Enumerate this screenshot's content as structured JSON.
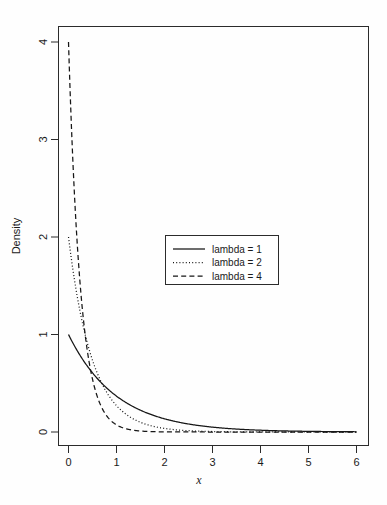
{
  "chart_data": {
    "type": "line",
    "title": "",
    "subtitle": "",
    "xlabel": "x",
    "ylabel": "Density",
    "xlim": [
      0,
      6
    ],
    "ylim": [
      0,
      4
    ],
    "xticks": [
      "0",
      "1",
      "2",
      "3",
      "4",
      "5",
      "6"
    ],
    "xtick_values": [
      0,
      1,
      2,
      3,
      4,
      5,
      6
    ],
    "yticks": [
      "0",
      "1",
      "2",
      "3",
      "4"
    ],
    "ytick_values": [
      0,
      1,
      2,
      3,
      4
    ],
    "grid": false,
    "legend_position": "center",
    "legend_entries": [
      {
        "label": "lambda = 1",
        "style": "solid",
        "lambda": 1
      },
      {
        "label": "lambda = 2",
        "style": "dotted",
        "lambda": 2
      },
      {
        "label": "lambda = 4",
        "style": "dashed",
        "lambda": 4
      }
    ],
    "series": [
      {
        "name": "lambda = 1",
        "style": "solid",
        "lambda": 1,
        "x": [
          0,
          0.25,
          0.5,
          0.75,
          1,
          1.25,
          1.5,
          1.75,
          2,
          2.5,
          3,
          3.5,
          4,
          4.5,
          5,
          5.5,
          6
        ],
        "values": [
          1,
          0.779,
          0.607,
          0.472,
          0.368,
          0.287,
          0.223,
          0.174,
          0.135,
          0.082,
          0.05,
          0.03,
          0.018,
          0.011,
          0.007,
          0.004,
          0.002
        ]
      },
      {
        "name": "lambda = 2",
        "style": "dotted",
        "lambda": 2,
        "x": [
          0,
          0.25,
          0.5,
          0.75,
          1,
          1.25,
          1.5,
          1.75,
          2,
          2.5,
          3,
          3.5,
          4,
          4.5,
          5,
          5.5,
          6
        ],
        "values": [
          2,
          1.213,
          0.736,
          0.446,
          0.271,
          0.164,
          0.1,
          0.06,
          0.037,
          0.013,
          0.005,
          0.002,
          0.001,
          0.0002,
          0.0001,
          0.0,
          0.0
        ]
      },
      {
        "name": "lambda = 4",
        "style": "dashed",
        "lambda": 4,
        "x": [
          0,
          0.25,
          0.5,
          0.75,
          1,
          1.25,
          1.5,
          1.75,
          2,
          2.5,
          3,
          3.5,
          4,
          4.5,
          5,
          5.5,
          6
        ],
        "values": [
          4,
          1.472,
          0.541,
          0.199,
          0.073,
          0.027,
          0.01,
          0.004,
          0.001,
          0.0002,
          0.0,
          0.0,
          0.0,
          0.0,
          0.0,
          0.0,
          0.0
        ]
      }
    ],
    "annotations": []
  },
  "axes": {
    "y_title": "Density",
    "x_title": "x"
  }
}
